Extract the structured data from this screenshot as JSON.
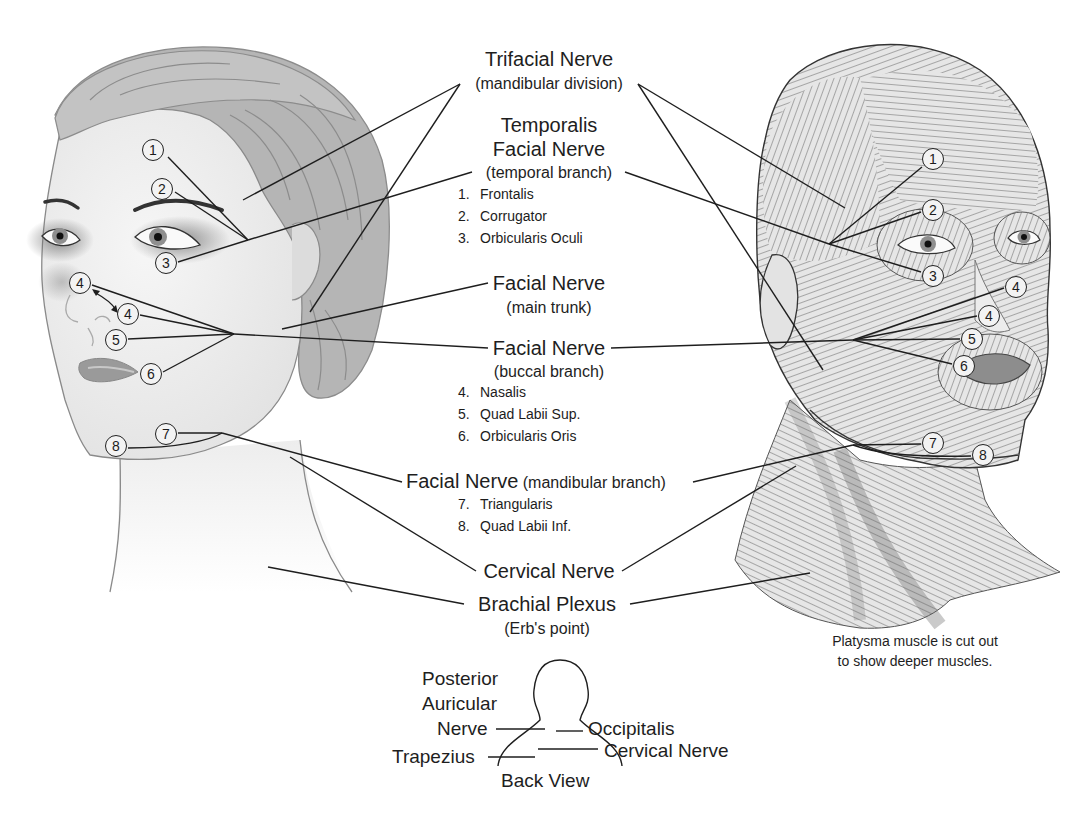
{
  "nerves": {
    "trifacial": {
      "name": "Trifacial Nerve",
      "sub": "(mandibular division)"
    },
    "temporalis": {
      "name": "Temporalis"
    },
    "facial_temporal": {
      "name": "Facial Nerve",
      "sub": "(temporal branch)",
      "muscles": [
        {
          "num": "1.",
          "name": "Frontalis"
        },
        {
          "num": "2.",
          "name": "Corrugator"
        },
        {
          "num": "3.",
          "name": "Orbicularis Oculi"
        }
      ]
    },
    "facial_main": {
      "name": "Facial Nerve",
      "sub": "(main trunk)"
    },
    "facial_buccal": {
      "name": "Facial Nerve",
      "sub": "(buccal branch)",
      "muscles": [
        {
          "num": "4.",
          "name": "Nasalis"
        },
        {
          "num": "5.",
          "name": "Quad Labii Sup."
        },
        {
          "num": "6.",
          "name": "Orbicularis Oris"
        }
      ]
    },
    "facial_mandibular": {
      "name": "Facial Nerve",
      "sub": "(mandibular branch)",
      "muscles": [
        {
          "num": "7.",
          "name": "Triangularis"
        },
        {
          "num": "8.",
          "name": "Quad Labii Inf."
        }
      ]
    },
    "cervical": {
      "name": "Cervical Nerve"
    },
    "brachial": {
      "name": "Brachial Plexus",
      "sub": "(Erb's point)"
    }
  },
  "note": {
    "line1": "Platysma muscle is cut out",
    "line2": "to show deeper muscles."
  },
  "back_view": {
    "caption": "Back View",
    "posterior_line1": "Posterior",
    "posterior_line2": "Auricular",
    "posterior_line3": "Nerve",
    "occipitalis": "Occipitalis",
    "cervical": "Cervical Nerve",
    "trapezius": "Trapezius"
  },
  "callouts_left": [
    {
      "n": "1",
      "x": 153,
      "y": 150
    },
    {
      "n": "2",
      "x": 162,
      "y": 189
    },
    {
      "n": "3",
      "x": 166,
      "y": 263
    },
    {
      "n": "4",
      "x": 80,
      "y": 283
    },
    {
      "n": "4",
      "x": 128,
      "y": 314
    },
    {
      "n": "5",
      "x": 116,
      "y": 340
    },
    {
      "n": "6",
      "x": 151,
      "y": 374
    },
    {
      "n": "7",
      "x": 166,
      "y": 434
    },
    {
      "n": "8",
      "x": 116,
      "y": 446
    }
  ],
  "callouts_right": [
    {
      "n": "1",
      "x": 933,
      "y": 159
    },
    {
      "n": "2",
      "x": 933,
      "y": 210
    },
    {
      "n": "3",
      "x": 933,
      "y": 276
    },
    {
      "n": "4",
      "x": 1016,
      "y": 287
    },
    {
      "n": "4",
      "x": 989,
      "y": 316
    },
    {
      "n": "5",
      "x": 972,
      "y": 339
    },
    {
      "n": "6",
      "x": 964,
      "y": 366
    },
    {
      "n": "7",
      "x": 933,
      "y": 443
    },
    {
      "n": "8",
      "x": 983,
      "y": 455
    }
  ],
  "colors": {
    "line": "#1e1e1e",
    "skin": "#efefef",
    "hair": "#b3b3b3",
    "hair_stroke": "#8c8c8c",
    "muscle_fill": "#e3e3e3",
    "muscle_stroke": "#6f6f6f",
    "callout_fill": "#f3f3f3"
  }
}
